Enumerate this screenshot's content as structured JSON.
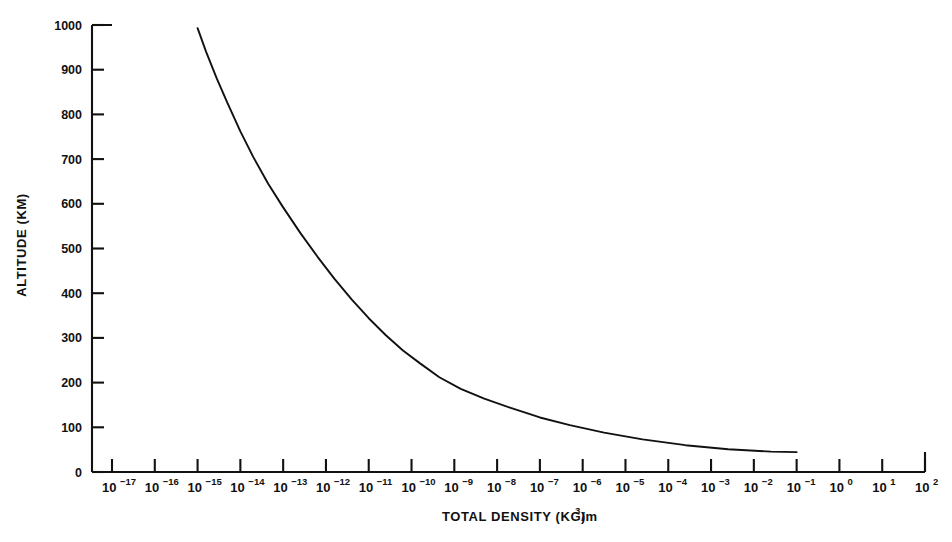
{
  "chart_data": {
    "type": "line",
    "title": "",
    "xlabel": "TOTAL DENSITY (KG/m",
    "xlabel_exponent": "3",
    "xlabel_suffix": ")",
    "ylabel": "ALTITUDE (KM)",
    "xscale": "log",
    "yscale": "linear",
    "xlim": [
      1e-17,
      100.0
    ],
    "ylim": [
      0,
      1000
    ],
    "grid": false,
    "legend": false,
    "x_tick_exponents": [
      -17,
      -16,
      -15,
      -14,
      -13,
      -12,
      -11,
      -10,
      -9,
      -8,
      -7,
      -6,
      -5,
      -4,
      -3,
      -2,
      -1,
      0,
      1,
      2
    ],
    "x_tick_mantissa": "10",
    "y_ticks": [
      0,
      100,
      200,
      300,
      400,
      500,
      600,
      700,
      800,
      900,
      1000
    ],
    "series": [
      {
        "name": "Total density vs altitude",
        "x_log10": [
          -15.0,
          -14.8,
          -14.55,
          -14.3,
          -14.0,
          -13.7,
          -13.35,
          -13.0,
          -12.6,
          -12.2,
          -11.8,
          -11.4,
          -11.0,
          -10.6,
          -10.2,
          -9.8,
          -9.35,
          -8.85,
          -8.3,
          -7.7,
          -7.0,
          -6.3,
          -5.5,
          -4.6,
          -3.6,
          -2.6,
          -1.6,
          -1.0
        ],
        "y_km": [
          993.0,
          940.0,
          880.0,
          825.0,
          762.0,
          705.0,
          645.0,
          592.0,
          535.0,
          482.0,
          432.0,
          386.0,
          344.0,
          306.0,
          272.0,
          243.0,
          212.0,
          186.0,
          164.0,
          144.0,
          122.0,
          105.0,
          88.0,
          73.0,
          60.0,
          51.0,
          45.5,
          44.5
        ]
      }
    ]
  },
  "axes": {
    "y_axis_label": "ALTITUDE (KM)",
    "x_axis_label_base": "TOTAL DENSITY (KG/m",
    "x_axis_label_exp": "3",
    "x_axis_label_end": ")"
  },
  "colors": {
    "curve": "#111111",
    "axis": "#111111",
    "background": "#ffffff"
  }
}
